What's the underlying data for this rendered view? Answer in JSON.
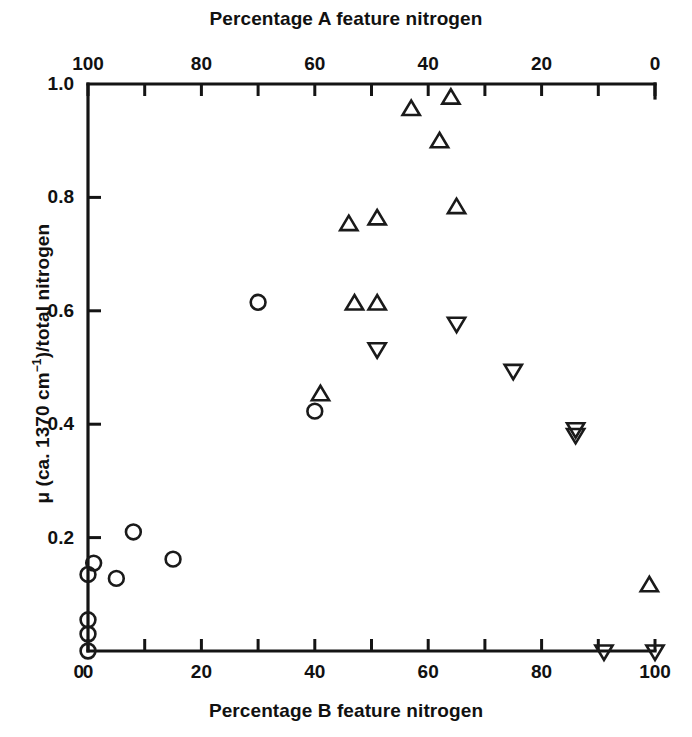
{
  "chart_data": {
    "type": "scatter",
    "title": "",
    "xlabel": "Percentage B feature nitrogen",
    "xlabel_top": "Percentage A feature nitrogen",
    "ylabel": "μ (ca. 1370 cm⁻¹)/total nitrogen",
    "xlim": [
      0,
      100
    ],
    "xlim_top": [
      100,
      0
    ],
    "ylim": [
      0,
      1.0
    ],
    "grid": false,
    "legend": "none",
    "axis_top_note": "Top axis is reversed: 100 at left, 0 at right; it is the complement of the bottom axis.",
    "xticks_bottom": [
      0,
      20,
      40,
      60,
      80,
      100
    ],
    "xtick_labels_bottom": [
      "0",
      "20",
      "40",
      "60",
      "80",
      "100"
    ],
    "xticks_minor_bottom": [
      10,
      30,
      50,
      70,
      90
    ],
    "xticks_top": [
      100,
      80,
      60,
      40,
      20,
      0
    ],
    "xtick_labels_top": [
      "100",
      "80",
      "60",
      "40",
      "20",
      "0"
    ],
    "xticks_minor_top": [
      90,
      70,
      50,
      30,
      10
    ],
    "yticks": [
      0.2,
      0.4,
      0.6,
      0.8,
      1.0
    ],
    "ytick_labels": [
      "0.2",
      "0.4",
      "0.6",
      "0.8",
      "1.0"
    ],
    "ytick_label_zero": "0",
    "series": [
      {
        "name": "circle",
        "marker": "open-circle",
        "color": "#1a1a1a",
        "points": [
          {
            "x": 0,
            "y": 0.0
          },
          {
            "x": 0,
            "y": 0.03
          },
          {
            "x": 0,
            "y": 0.055
          },
          {
            "x": 0,
            "y": 0.135
          },
          {
            "x": 1,
            "y": 0.155
          },
          {
            "x": 5,
            "y": 0.128
          },
          {
            "x": 8,
            "y": 0.21
          },
          {
            "x": 15,
            "y": 0.162
          },
          {
            "x": 30,
            "y": 0.615
          },
          {
            "x": 40,
            "y": 0.423
          }
        ]
      },
      {
        "name": "up-triangle",
        "marker": "open-triangle-up",
        "color": "#1a1a1a",
        "points": [
          {
            "x": 41,
            "y": 0.452
          },
          {
            "x": 46,
            "y": 0.752
          },
          {
            "x": 47,
            "y": 0.612
          },
          {
            "x": 51,
            "y": 0.612
          },
          {
            "x": 51,
            "y": 0.762
          },
          {
            "x": 57,
            "y": 0.955
          },
          {
            "x": 62,
            "y": 0.898
          },
          {
            "x": 64,
            "y": 0.975
          },
          {
            "x": 65,
            "y": 0.782
          },
          {
            "x": 99,
            "y": 0.115
          }
        ]
      },
      {
        "name": "down-triangle",
        "marker": "open-triangle-down",
        "color": "#1a1a1a",
        "points": [
          {
            "x": 51,
            "y": 0.533
          },
          {
            "x": 65,
            "y": 0.578
          },
          {
            "x": 75,
            "y": 0.495
          },
          {
            "x": 86,
            "y": 0.392
          },
          {
            "x": 86,
            "y": 0.382
          },
          {
            "x": 91,
            "y": 0.0
          },
          {
            "x": 100,
            "y": 0.0
          }
        ]
      }
    ]
  },
  "geometry": {
    "plot_left": 88,
    "plot_right": 655,
    "plot_top": 84,
    "plot_bottom": 651
  }
}
